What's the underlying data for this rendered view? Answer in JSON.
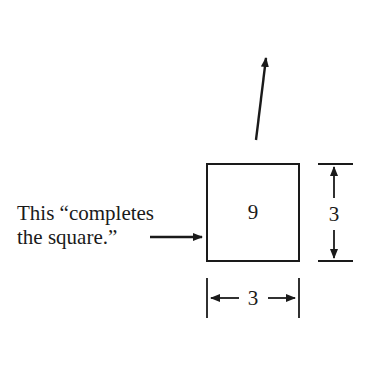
{
  "diagram": {
    "caption_line1": "This “completes",
    "caption_line2": "the square.”",
    "square_area": "9",
    "side_height": "3",
    "side_width": "3"
  }
}
